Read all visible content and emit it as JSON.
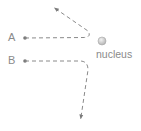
{
  "diagram": {
    "labels": {
      "particle_a": "A",
      "particle_b": "B",
      "nucleus": "nucleus"
    },
    "colors": {
      "path": "#8a8a8a",
      "text": "#8a8a8a",
      "nucleus_fill": "#d0d0d0",
      "nucleus_stroke": "#a0a0a0"
    },
    "paths": [
      {
        "id": "A",
        "description": "Path A travels right toward nucleus, then deflects sharply upward-left"
      },
      {
        "id": "B",
        "description": "Path B travels right, passes nucleus at greater distance, deflects downward"
      }
    ]
  }
}
